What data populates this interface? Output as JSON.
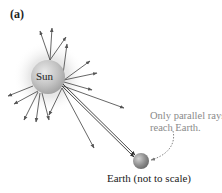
{
  "figure": {
    "panel_label": "(a)",
    "sun_label": "Sun",
    "note_line1": "Only parallel rays",
    "note_line2": "reach Earth.",
    "earth_label": "Earth (not to scale)"
  },
  "colors": {
    "ray": "#555555",
    "parallel_ray": "#333333",
    "note_text": "#8a8a8a",
    "sun_body": "#bdbdbd",
    "earth_body": "#8f8f8f"
  }
}
